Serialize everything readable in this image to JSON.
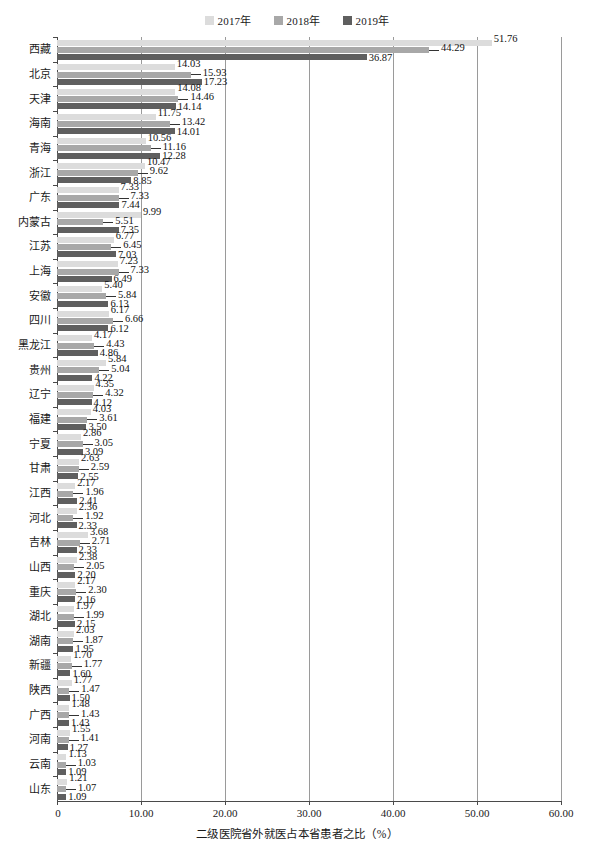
{
  "legend": {
    "position": "top-center",
    "entries": [
      {
        "label": "2017年",
        "color": "#dcdcdc"
      },
      {
        "label": "2018年",
        "color": "#a8a8a8"
      },
      {
        "label": "2019年",
        "color": "#5f5f5f"
      }
    ]
  },
  "axis": {
    "title": "二级医院省外就医占本省患者之比（%）",
    "ticks": [
      "0",
      "10.00",
      "20.00",
      "30.00",
      "40.00",
      "50.00",
      "60.00"
    ],
    "tick_values": [
      0,
      10,
      20,
      30,
      40,
      50,
      60
    ]
  },
  "chart_data": {
    "type": "bar",
    "orientation": "horizontal",
    "title": "",
    "xlabel": "二级医院省外就医占本省患者之比（%）",
    "ylabel": "",
    "xlim": [
      0,
      60
    ],
    "grid": true,
    "legend_position": "top-center",
    "categories": [
      "西藏",
      "北京",
      "天津",
      "海南",
      "青海",
      "浙江",
      "广东",
      "内蒙古",
      "江苏",
      "上海",
      "安徽",
      "四川",
      "黑龙江",
      "贵州",
      "辽宁",
      "福建",
      "宁夏",
      "甘肃",
      "江西",
      "河北",
      "吉林",
      "山西",
      "重庆",
      "湖北",
      "湖南",
      "新疆",
      "陕西",
      "广西",
      "河南",
      "云南",
      "山东"
    ],
    "series": [
      {
        "name": "2017年",
        "color": "#dcdcdc",
        "values": [
          51.76,
          14.03,
          14.08,
          11.75,
          10.56,
          10.47,
          7.33,
          9.99,
          6.77,
          7.23,
          5.4,
          6.17,
          4.17,
          5.84,
          4.35,
          4.03,
          2.86,
          2.63,
          2.17,
          2.36,
          3.68,
          2.38,
          2.17,
          1.97,
          2.03,
          1.7,
          1.77,
          1.48,
          1.55,
          1.13,
          1.21
        ]
      },
      {
        "name": "2018年",
        "color": "#a8a8a8",
        "values": [
          44.29,
          15.93,
          14.46,
          13.42,
          11.16,
          9.62,
          7.33,
          5.51,
          6.45,
          7.33,
          5.84,
          6.66,
          4.43,
          5.04,
          4.32,
          3.61,
          3.05,
          2.59,
          1.96,
          1.92,
          2.71,
          2.05,
          2.3,
          1.99,
          1.87,
          1.77,
          1.47,
          1.43,
          1.41,
          1.03,
          1.07
        ]
      },
      {
        "name": "2019年",
        "color": "#5f5f5f",
        "values": [
          36.87,
          17.23,
          14.14,
          14.01,
          12.28,
          8.85,
          7.44,
          7.35,
          7.03,
          6.49,
          6.13,
          6.12,
          4.86,
          4.22,
          4.12,
          3.5,
          3.09,
          2.55,
          2.41,
          2.33,
          2.33,
          2.2,
          2.16,
          2.15,
          1.95,
          1.6,
          1.5,
          1.43,
          1.27,
          1.09,
          1.09
        ]
      }
    ]
  }
}
